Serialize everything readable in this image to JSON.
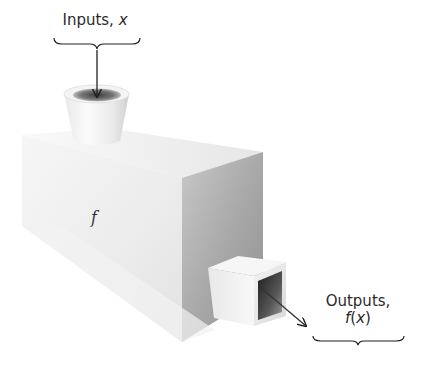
{
  "diagram": {
    "type": "function-machine",
    "input_label": {
      "text": "Inputs, ",
      "variable": "x"
    },
    "output_label": {
      "text": "Outputs,",
      "function_name": "f",
      "open_paren": "(",
      "variable": "x",
      "close_paren": ")"
    },
    "machine_label": "f",
    "colors": {
      "background": "#ffffff",
      "front_face_light": "#efefef",
      "side_face_dark": "#a8a8a8",
      "arrow": "#222222",
      "text": "#2a2a2a"
    }
  }
}
